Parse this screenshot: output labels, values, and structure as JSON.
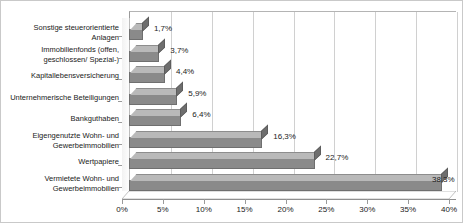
{
  "chart_data": {
    "type": "bar",
    "orientation": "horizontal",
    "title": "",
    "xlabel": "",
    "ylabel": "",
    "xlim": [
      0,
      40
    ],
    "grid": true,
    "legend": false,
    "tick_labels": [
      "0%",
      "5%",
      "10%",
      "15%",
      "20%",
      "25%",
      "30%",
      "35%",
      "40%"
    ],
    "tick_values": [
      0,
      5,
      10,
      15,
      20,
      25,
      30,
      35,
      40
    ],
    "categories": [
      "Sonstige steuerorientierte Anlagen",
      "Immobilienfonds (offen, geschlossen/ Spezial-)",
      "Kapitallebensversicherung",
      "Unternehmerische Beteiligungen",
      "Bankguthaben",
      "Eigengenutzte Wohn- und Gewerbeimmobilien",
      "Wertpapiere",
      "Vermietete Wohn- und Gewerbeimmobilien"
    ],
    "category_lines": [
      [
        "Sonstige steuerorientierte",
        "Anlagen"
      ],
      [
        "Immobilienfonds (offen,",
        "geschlossen/ Spezial-)"
      ],
      [
        "Kapitallebensversicherung"
      ],
      [
        "Unternehmerische Beteiligungen"
      ],
      [
        "Bankguthaben"
      ],
      [
        "Eigengenutzte Wohn- und",
        "Gewerbeimmobilien"
      ],
      [
        "Wertpapiere"
      ],
      [
        "Vermietete Wohn- und",
        "Gewerbeimmobilien"
      ]
    ],
    "values": [
      1.7,
      3.7,
      4.4,
      5.9,
      6.4,
      16.3,
      22.7,
      38.3
    ],
    "data_labels": [
      "1,7%",
      "3,7%",
      "4,4%",
      "5,9%",
      "6,4%",
      "16,3%",
      "22,7%",
      "38,3%"
    ]
  },
  "style": {
    "bar_front": "#8a8a8a",
    "bar_top": "#b9b9b9",
    "bar_cap": "#6e6e6e",
    "grid_color": "#d0d0d0",
    "axis_color": "#8f8f8f",
    "text_color": "#1a1a1a",
    "background": "#ffffff"
  }
}
